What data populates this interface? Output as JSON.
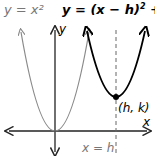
{
  "diagram": {
    "labels": {
      "parent_eq": "y = x²",
      "transformed_eq_prefix": "y = (x − h)",
      "transformed_eq_sup": "2",
      "transformed_eq_suffix": " + k",
      "vertex": "(h, k)",
      "axis_of_symmetry": "x = h",
      "x_axis": "x",
      "y_axis": "y"
    },
    "colors": {
      "parent_curve": "#8a8a8a",
      "transformed_curve": "#000000",
      "axes": "#222222",
      "dashed_line": "#666666",
      "parent_label": "#777777"
    }
  }
}
